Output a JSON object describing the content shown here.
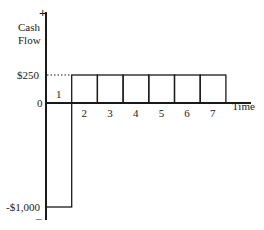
{
  "chart_data": {
    "type": "bar",
    "title": "",
    "xlabel": "Time",
    "ylabel": "Cash Flow",
    "ylabel_lines": [
      "Cash",
      "Flow"
    ],
    "y_positive_marker": "+",
    "y_negative_marker": "–",
    "categories": [
      "1",
      "2",
      "3",
      "4",
      "5",
      "6",
      "7"
    ],
    "values": [
      -1000,
      250,
      250,
      250,
      250,
      250,
      250
    ],
    "y_tick_labels": [
      {
        "value": 250,
        "label": "$250"
      },
      {
        "value": 0,
        "label": "0"
      },
      {
        "value": -1000,
        "label": "-$1,000"
      }
    ],
    "reference_line": {
      "value": 250,
      "style": "dotted"
    },
    "grid": false,
    "legend": null
  }
}
